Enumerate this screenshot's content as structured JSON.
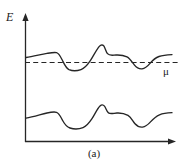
{
  "figure": {
    "caption": "(a)",
    "background_color": "#ffffff",
    "line_color": "#262626",
    "axes": {
      "y_axis_label": "E",
      "x_axis_label": "",
      "y_axis_name": "energy-axis",
      "x_axis_name": "position-axis",
      "origin_px": [
        25,
        142
      ],
      "y_axis_top_px": [
        25,
        14
      ],
      "x_axis_right_px": [
        175,
        142
      ],
      "arrowheads": [
        "y-axis-top",
        "x-axis-right"
      ]
    },
    "chemical_potential": {
      "label": "μ",
      "style": "dashed",
      "y_px": 62,
      "x_start_px": 25,
      "x_end_px": 180
    },
    "curves": [
      {
        "name": "upper-band-curve",
        "description": "upper energy band oscillating about the chemical potential",
        "points": [
          [
            26,
            57
          ],
          [
            34,
            56
          ],
          [
            42,
            54
          ],
          [
            50,
            53
          ],
          [
            55,
            52
          ],
          [
            58,
            53
          ],
          [
            61,
            58
          ],
          [
            64,
            64
          ],
          [
            68,
            69
          ],
          [
            74,
            70
          ],
          [
            80,
            69
          ],
          [
            86,
            65
          ],
          [
            92,
            57
          ],
          [
            97,
            49
          ],
          [
            101,
            45
          ],
          [
            104,
            46
          ],
          [
            107,
            53
          ],
          [
            112,
            55
          ],
          [
            120,
            55
          ],
          [
            126,
            56
          ],
          [
            131,
            60
          ],
          [
            136,
            65
          ],
          [
            141,
            68
          ],
          [
            147,
            67
          ],
          [
            152,
            62
          ],
          [
            158,
            58
          ],
          [
            165,
            56
          ],
          [
            172,
            55
          ]
        ]
      },
      {
        "name": "lower-band-curve",
        "description": "lower energy band well below the chemical potential",
        "points": [
          [
            26,
            118
          ],
          [
            34,
            116
          ],
          [
            42,
            114
          ],
          [
            50,
            112
          ],
          [
            55,
            112
          ],
          [
            58,
            114
          ],
          [
            61,
            119
          ],
          [
            65,
            124
          ],
          [
            70,
            127
          ],
          [
            78,
            128
          ],
          [
            84,
            126
          ],
          [
            90,
            120
          ],
          [
            96,
            112
          ],
          [
            101,
            106
          ],
          [
            104,
            105
          ],
          [
            107,
            110
          ],
          [
            112,
            113
          ],
          [
            120,
            113
          ],
          [
            126,
            115
          ],
          [
            131,
            119
          ],
          [
            136,
            124
          ],
          [
            141,
            126
          ],
          [
            147,
            125
          ],
          [
            152,
            121
          ],
          [
            158,
            117
          ],
          [
            165,
            114
          ],
          [
            172,
            113
          ]
        ]
      }
    ]
  }
}
